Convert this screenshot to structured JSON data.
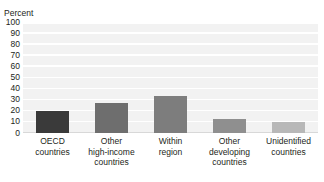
{
  "chart_data": {
    "type": "bar",
    "title": "",
    "xlabel": "",
    "ylabel": "Percent",
    "ylim": [
      0,
      100
    ],
    "ytick_labels": [
      "100",
      "90",
      "80",
      "70",
      "60",
      "50",
      "40",
      "30",
      "20",
      "10",
      "0"
    ],
    "ytick_values": [
      100,
      90,
      80,
      70,
      60,
      50,
      40,
      30,
      20,
      10,
      0
    ],
    "grid": true,
    "legend": "none",
    "categories": [
      "OECD countries",
      "Other high-income countries",
      "Within region",
      "Other developing countries",
      "Unidentified countries"
    ],
    "category_lines": [
      [
        "OECD",
        "countries"
      ],
      [
        "Other",
        "high-income",
        "countries"
      ],
      [
        "Within",
        "region"
      ],
      [
        "Other",
        "developing",
        "countries"
      ],
      [
        "Unidentified",
        "countries"
      ]
    ],
    "values": [
      20,
      27,
      33,
      13,
      10
    ],
    "bar_colors": [
      "#3a3a3a",
      "#6e6e6e",
      "#7d7d7d",
      "#8f8f8f",
      "#b8b8b8"
    ]
  },
  "colors": {
    "plot_background": "#f2f2f2",
    "gridline": "#ffffff",
    "text": "#231f20"
  }
}
